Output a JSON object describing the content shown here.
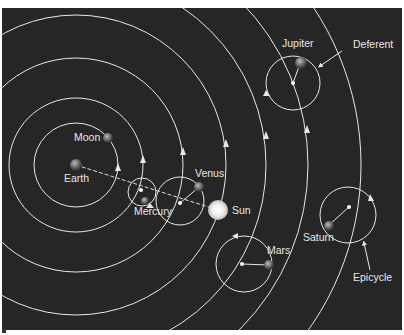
{
  "diagram": {
    "background": "#262626",
    "line_color": "#e8e8e8",
    "labels": {
      "moon": "Moon",
      "earth": "Earth",
      "mercury": "Mercury",
      "venus": "Venus",
      "sun": "Sun",
      "mars": "Mars",
      "jupiter": "Jupiter",
      "saturn": "Saturn",
      "deferent": "Deferent",
      "epicycle": "Epicycle"
    }
  }
}
